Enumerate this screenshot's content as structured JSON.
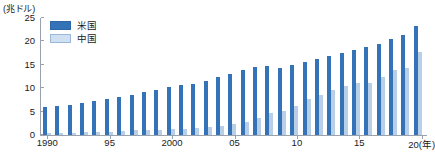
{
  "chart_data": {
    "type": "bar",
    "title": "",
    "subtitle": "",
    "xlabel": "",
    "ylabel": "(兆ドル)",
    "unit_caption": "(兆ドル)",
    "ylim": [
      0,
      25
    ],
    "yticks": [
      0,
      5,
      10,
      15,
      20,
      25
    ],
    "ytick_labels": [
      "0",
      "5",
      "10",
      "15",
      "20",
      "25"
    ],
    "grid": false,
    "legend_position": "top-left",
    "categories": [
      "1990",
      "1991",
      "1992",
      "1993",
      "1994",
      "1995",
      "1996",
      "1997",
      "1998",
      "1999",
      "2000",
      "2001",
      "2002",
      "2003",
      "2004",
      "2005",
      "2006",
      "2007",
      "2008",
      "2009",
      "2010",
      "2011",
      "2012",
      "2013",
      "2014",
      "2015",
      "2016",
      "2017",
      "2018",
      "2019",
      "2020"
    ],
    "xtick_labels": [
      {
        "label": "1990",
        "category": "1990"
      },
      {
        "label": "95",
        "category": "1995"
      },
      {
        "label": "2000",
        "category": "2000"
      },
      {
        "label": "05",
        "category": "2005"
      },
      {
        "label": "10",
        "category": "2010"
      },
      {
        "label": "15",
        "category": "2015"
      },
      {
        "label": "20(年)",
        "category": "2020"
      }
    ],
    "series": [
      {
        "name": "米国",
        "color": "#3573b9",
        "values": [
          6.0,
          6.2,
          6.5,
          6.9,
          7.3,
          7.6,
          8.1,
          8.6,
          9.1,
          9.6,
          10.2,
          10.6,
          11.0,
          11.5,
          12.3,
          13.0,
          13.8,
          14.5,
          14.8,
          14.4,
          15.0,
          15.5,
          16.2,
          16.8,
          17.5,
          18.2,
          18.7,
          19.5,
          20.6,
          21.4,
          23.3
        ]
      },
      {
        "name": "中国",
        "color": "#b9cfe8",
        "values": [
          0.4,
          0.4,
          0.5,
          0.6,
          0.6,
          0.7,
          0.9,
          1.0,
          1.0,
          1.1,
          1.2,
          1.3,
          1.5,
          1.7,
          1.9,
          2.3,
          2.8,
          3.6,
          4.6,
          5.1,
          6.1,
          7.6,
          8.5,
          9.6,
          10.5,
          11.1,
          11.2,
          12.3,
          13.9,
          14.3,
          17.7
        ]
      }
    ],
    "legend": [
      {
        "label": "米国",
        "color": "#3573b9",
        "swatch": "dark-blue"
      },
      {
        "label": "中国",
        "color": "#cfe0f2",
        "swatch": "light-blue"
      }
    ]
  }
}
